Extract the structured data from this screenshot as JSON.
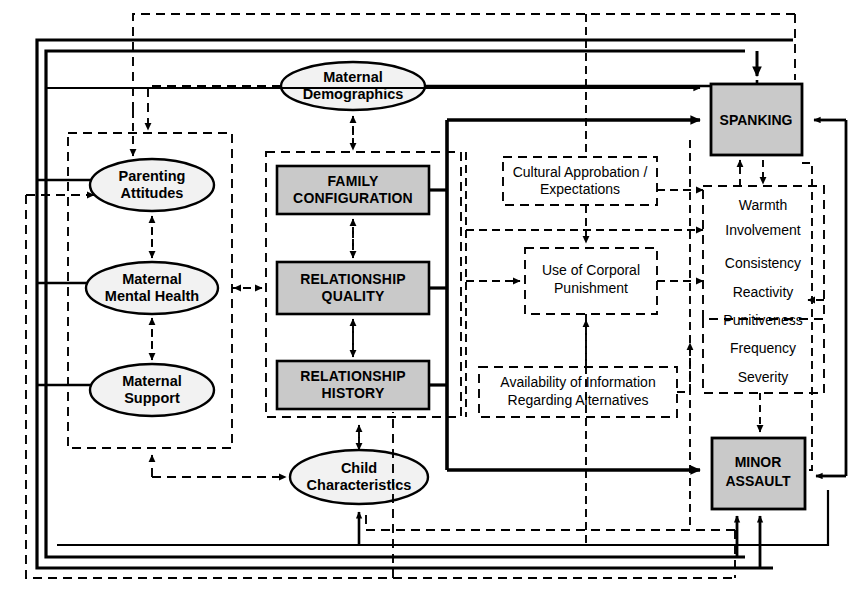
{
  "diagram": {
    "colors": {
      "shaded_fill": "#c9c9c9",
      "oval_fill": "#f2f2f2",
      "stroke": "#000000",
      "background": "#ffffff"
    },
    "ovals": [
      {
        "id": "maternal-demographics",
        "label_line1": "Maternal",
        "label_line2": "Demographics"
      },
      {
        "id": "parenting-attitudes",
        "label_line1": "Parenting",
        "label_line2": "Attitudes"
      },
      {
        "id": "maternal-mental-health",
        "label_line1": "Maternal",
        "label_line2": "Mental Health"
      },
      {
        "id": "maternal-support",
        "label_line1": "Maternal",
        "label_line2": "Support"
      },
      {
        "id": "child-characteristics",
        "label_line1": "Child",
        "label_line2": "Characteristics"
      }
    ],
    "shaded_boxes": [
      {
        "id": "family-configuration",
        "label_line1": "FAMILY",
        "label_line2": "CONFIGURATION"
      },
      {
        "id": "relationship-quality",
        "label_line1": "RELATIONSHIP",
        "label_line2": "QUALITY"
      },
      {
        "id": "relationship-history",
        "label_line1": "RELATIONSHIP",
        "label_line2": "HISTORY"
      }
    ],
    "outcome_boxes": [
      {
        "id": "spanking",
        "label_line1": "SPANKING",
        "label_line2": ""
      },
      {
        "id": "minor-assault",
        "label_line1": "MINOR",
        "label_line2": "ASSAULT"
      }
    ],
    "dashed_boxes": [
      {
        "id": "cultural-approbation",
        "label_line1": "Cultural Approbation /",
        "label_line2": "Expectations"
      },
      {
        "id": "use-of-corporal-punishment",
        "label_line1": "Use of Corporal",
        "label_line2": "Punishment"
      },
      {
        "id": "availability-of-information",
        "label_line1": "Availability of Information",
        "label_line2": "Regarding Alternatives"
      }
    ],
    "attributes": {
      "id": "parenting-attributes-list",
      "items": [
        "Warmth",
        "Involvement",
        "Consistency",
        "Reactivity",
        "Punitiveness",
        "Frequency",
        "Severity"
      ]
    }
  }
}
